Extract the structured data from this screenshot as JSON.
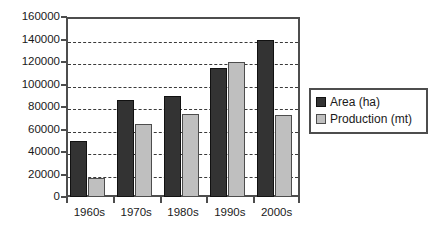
{
  "chart_data": {
    "type": "bar",
    "title": "",
    "xlabel": "",
    "ylabel": "",
    "categories": [
      "1960s",
      "1970s",
      "1980s",
      "1990s",
      "2000s"
    ],
    "series": [
      {
        "name": "Area (ha)",
        "color": "#333333",
        "values": [
          50000,
          86000,
          90000,
          115000,
          140000
        ]
      },
      {
        "name": "Production (mt)",
        "color": "#bfbfbf",
        "values": [
          17000,
          65000,
          74000,
          120000,
          73000
        ]
      }
    ],
    "ylim": [
      0,
      160000
    ],
    "ytick_values": [
      0,
      20000,
      40000,
      60000,
      80000,
      100000,
      120000,
      140000,
      160000
    ],
    "ytick_labels": [
      "0",
      "20000",
      "40000",
      "60000",
      "80000",
      "100000",
      "120000",
      "140000",
      "160000"
    ],
    "grid": true,
    "grid_style": "dashed",
    "grid_axis": "y",
    "legend": true,
    "legend_position": "right",
    "legend_entries": [
      "Area (ha)",
      "Production (mt)"
    ],
    "plot_background": "#ffffff",
    "axis_color": "#4d4d4d",
    "text_color": "#1a1a1a"
  }
}
